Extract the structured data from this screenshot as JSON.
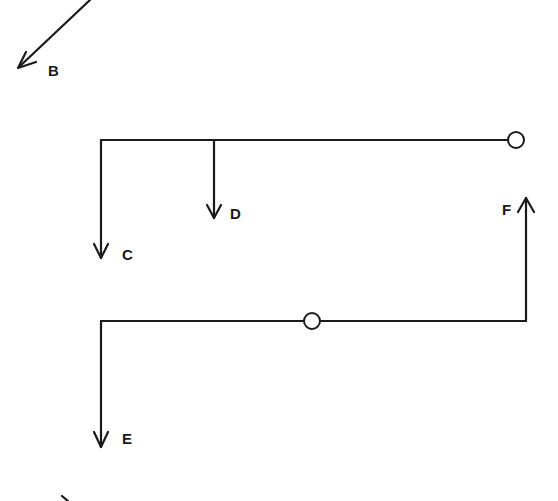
{
  "diagram": {
    "type": "force/vector schematic",
    "colors": {
      "stroke": "#1a1a1a",
      "background": "#ffffff"
    },
    "labels": {
      "B": "B",
      "C": "C",
      "D": "D",
      "E": "E",
      "F": "F"
    },
    "elements": [
      {
        "id": "B",
        "kind": "arrow",
        "direction": "down-left",
        "from": [
          90,
          0
        ],
        "to": [
          18,
          68
        ]
      },
      {
        "id": "top-beam",
        "kind": "line",
        "from": [
          101,
          140
        ],
        "to": [
          508,
          140
        ]
      },
      {
        "id": "top-pivot",
        "kind": "circle",
        "center": [
          516,
          140
        ],
        "r": 8
      },
      {
        "id": "C",
        "kind": "arrow",
        "direction": "down",
        "from": [
          101,
          140
        ],
        "to": [
          101,
          258
        ]
      },
      {
        "id": "D",
        "kind": "arrow",
        "direction": "down",
        "from": [
          214,
          140
        ],
        "to": [
          214,
          218
        ]
      },
      {
        "id": "bottom-beam",
        "kind": "line",
        "from": [
          101,
          321
        ],
        "to": [
          526,
          321
        ]
      },
      {
        "id": "bottom-pivot",
        "kind": "circle",
        "center": [
          312,
          321
        ],
        "r": 8
      },
      {
        "id": "E",
        "kind": "arrow",
        "direction": "down",
        "from": [
          101,
          321
        ],
        "to": [
          101,
          447
        ]
      },
      {
        "id": "F",
        "kind": "arrow",
        "direction": "up",
        "from": [
          526,
          321
        ],
        "to": [
          526,
          198
        ]
      }
    ]
  }
}
